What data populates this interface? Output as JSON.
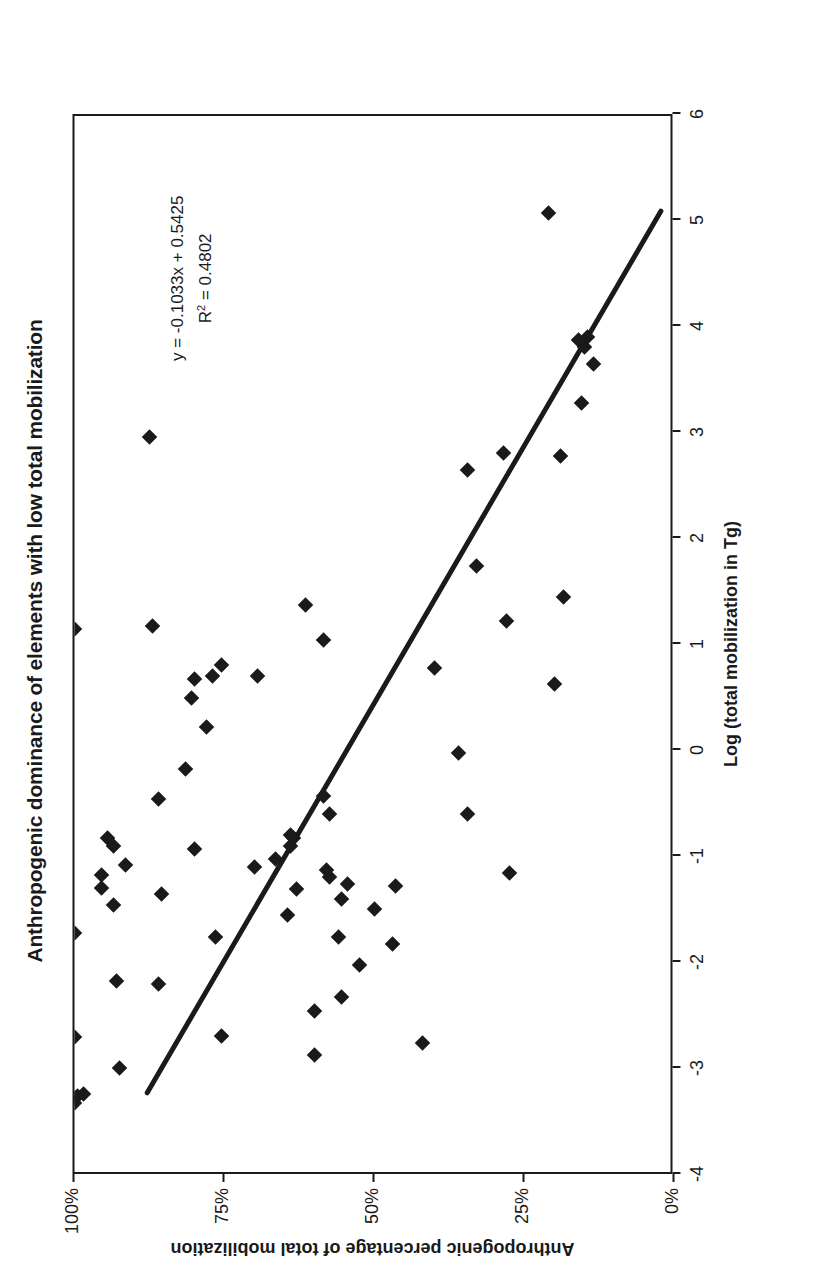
{
  "chart_data": {
    "type": "scatter",
    "title": "Anthropogenic dominance of elements with low total mobilization",
    "xlabel": "Log (total mobilization in Tg)",
    "ylabel": "Anthropogenic percentage of total mobilization",
    "xlim": [
      -4,
      6
    ],
    "ylim": [
      0,
      1
    ],
    "xticks": [
      -4,
      -3,
      -2,
      -1,
      0,
      1,
      2,
      3,
      4,
      5,
      6
    ],
    "xticklabels": [
      "-4",
      "-3",
      "-2",
      "-1",
      "0",
      "1",
      "2",
      "3",
      "4",
      "5",
      "6"
    ],
    "yticks": [
      0,
      0.25,
      0.5,
      0.75,
      1.0
    ],
    "yticklabels": [
      "0%",
      "25%",
      "50%",
      "75%",
      "100%"
    ],
    "grid": false,
    "legend": null,
    "annotations": {
      "equation": "y = -0.1033x + 0.5425",
      "r_squared_prefix": "R",
      "r_squared_sup": "2",
      "r_squared_value": " = 0.4802"
    },
    "trendline": {
      "slope": -0.1033,
      "intercept": 0.5425,
      "r_squared": 0.4802,
      "x_start": -3.25,
      "x_end": 5.1,
      "y_start": 0.878,
      "y_end": 0.016
    },
    "series": [
      {
        "name": "elements",
        "marker": "diamond",
        "color": "#1a1a1a",
        "points": [
          [
            -3.35,
            1.0
          ],
          [
            -3.3,
            1.0
          ],
          [
            -3.28,
            0.995
          ],
          [
            -3.26,
            0.985
          ],
          [
            -2.73,
            1.0
          ],
          [
            -1.75,
            1.0
          ],
          [
            1.12,
            1.0
          ],
          [
            -3.02,
            0.925
          ],
          [
            -2.2,
            0.93
          ],
          [
            -1.48,
            0.935
          ],
          [
            -1.32,
            0.955
          ],
          [
            -1.2,
            0.955
          ],
          [
            -1.1,
            0.915
          ],
          [
            -0.92,
            0.935
          ],
          [
            -0.85,
            0.945
          ],
          [
            -2.23,
            0.86
          ],
          [
            -1.38,
            0.855
          ],
          [
            -0.48,
            0.86
          ],
          [
            1.15,
            0.87
          ],
          [
            2.93,
            0.875
          ],
          [
            -0.95,
            0.8
          ],
          [
            -0.2,
            0.815
          ],
          [
            0.2,
            0.78
          ],
          [
            0.47,
            0.805
          ],
          [
            0.65,
            0.8
          ],
          [
            0.68,
            0.77
          ],
          [
            0.78,
            0.755
          ],
          [
            -2.72,
            0.755
          ],
          [
            -1.78,
            0.765
          ],
          [
            -1.12,
            0.7
          ],
          [
            0.68,
            0.695
          ],
          [
            1.35,
            0.615
          ],
          [
            1.02,
            0.585
          ],
          [
            -2.9,
            0.6
          ],
          [
            -2.48,
            0.6
          ],
          [
            -1.58,
            0.645
          ],
          [
            -1.33,
            0.63
          ],
          [
            -1.05,
            0.665
          ],
          [
            -0.92,
            0.64
          ],
          [
            -0.85,
            0.635
          ],
          [
            -0.82,
            0.64
          ],
          [
            -0.45,
            0.585
          ],
          [
            -0.62,
            0.575
          ],
          [
            -2.35,
            0.555
          ],
          [
            -1.78,
            0.56
          ],
          [
            -1.42,
            0.555
          ],
          [
            -1.28,
            0.545
          ],
          [
            -1.22,
            0.575
          ],
          [
            -1.15,
            0.58
          ],
          [
            -2.05,
            0.525
          ],
          [
            -1.52,
            0.5
          ],
          [
            -1.85,
            0.47
          ],
          [
            -1.3,
            0.465
          ],
          [
            -2.78,
            0.42
          ],
          [
            0.75,
            0.4
          ],
          [
            -0.05,
            0.36
          ],
          [
            -0.62,
            0.345
          ],
          [
            1.72,
            0.33
          ],
          [
            2.62,
            0.345
          ],
          [
            1.2,
            0.28
          ],
          [
            2.78,
            0.285
          ],
          [
            -1.18,
            0.275
          ],
          [
            0.6,
            0.2
          ],
          [
            1.42,
            0.185
          ],
          [
            2.75,
            0.19
          ],
          [
            3.25,
            0.155
          ],
          [
            3.62,
            0.135
          ],
          [
            3.78,
            0.15
          ],
          [
            3.85,
            0.16
          ],
          [
            3.88,
            0.145
          ],
          [
            5.05,
            0.21
          ]
        ]
      }
    ]
  }
}
